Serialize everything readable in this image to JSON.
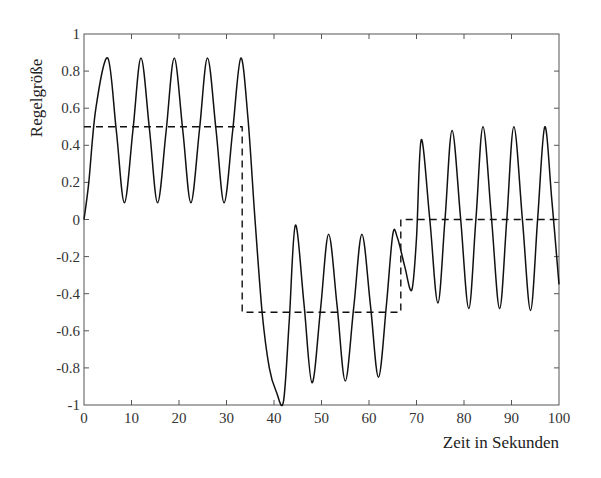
{
  "chart_data": {
    "type": "line",
    "title": "",
    "xlabel": "Zeit in Sekunden",
    "ylabel": "Regelgröße",
    "xlim": [
      0,
      100
    ],
    "ylim": [
      -1,
      1
    ],
    "xticks": [
      0,
      10,
      20,
      30,
      40,
      50,
      60,
      70,
      80,
      90,
      100
    ],
    "yticks": [
      -1,
      -0.8,
      -0.6,
      -0.4,
      -0.2,
      0,
      0.2,
      0.4,
      0.6,
      0.8,
      1
    ],
    "xtick_labels": [
      "0",
      "10",
      "20",
      "30",
      "40",
      "50",
      "60",
      "70",
      "80",
      "90",
      "100"
    ],
    "ytick_labels": [
      "-1",
      "-0.8",
      "-0.6",
      "-0.4",
      "-0.2",
      "0",
      "0.2",
      "0.4",
      "0.6",
      "0.8",
      "1"
    ],
    "grid": false,
    "legend": null,
    "series": [
      {
        "name": "Regelgröße (Istwert)",
        "style": "solid",
        "color": "#111111",
        "x": [
          0,
          1,
          2.5,
          5,
          6.8,
          8.5,
          10.3,
          12,
          13.8,
          15.5,
          17.3,
          19,
          20.8,
          22.5,
          24.3,
          26,
          27.8,
          29.5,
          31.3,
          33,
          34.5,
          36,
          37.5,
          39,
          40.5,
          42,
          43.2,
          44.5,
          46.3,
          48,
          49.8,
          51.5,
          53.3,
          55,
          56.8,
          58.5,
          60.3,
          62,
          63.7,
          65,
          66,
          67.5,
          69,
          70,
          71,
          72.8,
          74.5,
          76,
          77.5,
          79.3,
          81,
          82.5,
          84,
          85.8,
          87.5,
          89,
          90.5,
          92.3,
          94,
          95.5,
          97,
          98.5,
          100
        ],
        "y": [
          0,
          0.2,
          0.6,
          0.87,
          0.48,
          0.09,
          0.48,
          0.87,
          0.48,
          0.09,
          0.48,
          0.87,
          0.48,
          0.09,
          0.48,
          0.87,
          0.48,
          0.09,
          0.48,
          0.87,
          0.55,
          0.0,
          -0.5,
          -0.8,
          -0.93,
          -0.98,
          -0.55,
          -0.03,
          -0.45,
          -0.88,
          -0.48,
          -0.08,
          -0.47,
          -0.87,
          -0.47,
          -0.08,
          -0.46,
          -0.85,
          -0.45,
          -0.08,
          -0.1,
          -0.25,
          -0.38,
          -0.1,
          0.43,
          0.0,
          -0.45,
          0.0,
          0.48,
          0.0,
          -0.48,
          0.0,
          0.5,
          0.0,
          -0.48,
          0.0,
          0.5,
          0.0,
          -0.49,
          0.0,
          0.5,
          0.1,
          -0.35
        ]
      },
      {
        "name": "Sollwert (Führungsgröße)",
        "style": "dashed",
        "color": "#111111",
        "x": [
          0,
          33.3,
          33.3,
          66.7,
          66.7,
          100
        ],
        "y": [
          0.5,
          0.5,
          -0.5,
          -0.5,
          0,
          0
        ]
      }
    ]
  }
}
